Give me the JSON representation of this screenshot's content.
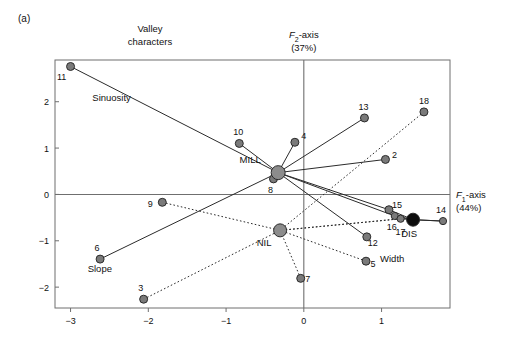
{
  "figure": {
    "panel_label": "(a)",
    "header": {
      "line1": "Valley",
      "line2": "characters"
    }
  },
  "axes": {
    "x_axis": {
      "label_main": "F",
      "label_sub": "1",
      "label_suffix": "-axis",
      "label_pct": "(44%)",
      "ticks": [
        -3,
        -2,
        -1,
        0,
        1
      ],
      "tick_labels": [
        "−3",
        "−2",
        "−1",
        "0",
        "1"
      ],
      "range": [
        -3.2,
        1.88
      ]
    },
    "y_axis": {
      "label_main": "F",
      "label_sub": "2",
      "label_suffix": "-axis",
      "label_pct": "(37%)",
      "ticks": [
        2,
        1,
        0,
        -1,
        -2
      ],
      "tick_labels": [
        "2",
        "1",
        "0",
        "−1",
        "−2"
      ],
      "range": [
        -2.45,
        2.9
      ]
    }
  },
  "colors": {
    "point_fill": "#7a7a7a",
    "point_stroke": "#2b2b2b",
    "centroid_fill": "#8c8c8c",
    "centroid_stroke": "#2b2b2b",
    "dis_fill": "#0d0d0d",
    "line": "#2b2b2b",
    "frame": "#6f6f6f",
    "axis": "#6f6f6f",
    "text": "#111111"
  },
  "chart_data": {
    "type": "scatter",
    "xlabel": "F1-axis (44%)",
    "ylabel": "F2-axis (37%)",
    "xlim": [
      -3.2,
      1.88
    ],
    "ylim": [
      -2.45,
      2.9
    ],
    "grid": false,
    "legend": "none",
    "groups": [
      {
        "name": "MILL",
        "centroid": {
          "x": -0.33,
          "y": 0.47
        },
        "centroid_label": "MILL",
        "label_offset": {
          "dx": -28,
          "dy": -10
        },
        "line_style": "solid",
        "centroid_size": 7,
        "centroid_fill": "#8c8c8c",
        "members": [
          "11",
          "10",
          "4",
          "13",
          "2",
          "8",
          "15",
          "16",
          "12",
          "6"
        ]
      },
      {
        "name": "NIL",
        "centroid": {
          "x": -0.305,
          "y": -0.775
        },
        "centroid_label": "NIL",
        "label_offset": {
          "dx": -16,
          "dy": 16
        },
        "line_style": "dotted",
        "centroid_size": 6.5,
        "centroid_fill": "#8c8c8c",
        "members": [
          "9",
          "3",
          "7",
          "18",
          "5",
          "17"
        ]
      },
      {
        "name": "DIS",
        "centroid": {
          "x": 1.405,
          "y": -0.545
        },
        "centroid_label": "DIS",
        "label_offset": {
          "dx": -4,
          "dy": 17
        },
        "line_style": "solid",
        "centroid_size": 6.5,
        "centroid_fill": "#0d0d0d",
        "members": [
          "14",
          "16b",
          "17b",
          "15b"
        ]
      }
    ],
    "points": [
      {
        "id": "11",
        "label": "11",
        "x": -3.0,
        "y": 2.76,
        "group": "MILL",
        "size": 4.0,
        "lx": -9,
        "ly": 14
      },
      {
        "id": "10",
        "label": "10",
        "x": -0.83,
        "y": 1.1,
        "group": "MILL",
        "size": 4.0,
        "lx": -1,
        "ly": -8
      },
      {
        "id": "4",
        "label": "4",
        "x": -0.115,
        "y": 1.125,
        "group": "MILL",
        "size": 4.0,
        "lx": 9,
        "ly": -3
      },
      {
        "id": "13",
        "label": "13",
        "x": 0.78,
        "y": 1.65,
        "group": "MILL",
        "size": 4.0,
        "lx": -1,
        "ly": -8
      },
      {
        "id": "2",
        "label": "2",
        "x": 1.05,
        "y": 0.755,
        "group": "MILL",
        "size": 4.0,
        "lx": 9,
        "ly": -1
      },
      {
        "id": "8",
        "label": "8",
        "x": -0.39,
        "y": 0.335,
        "group": "MILL",
        "size": 4.0,
        "lx": -3,
        "ly": 14
      },
      {
        "id": "12",
        "label": "12",
        "x": 0.81,
        "y": -0.915,
        "group": "MILL",
        "size": 4.0,
        "lx": 6,
        "ly": 9
      },
      {
        "id": "6",
        "label": "6",
        "x": -2.62,
        "y": -1.395,
        "group": "MILL",
        "size": 4.0,
        "lx": -3,
        "ly": -8
      },
      {
        "id": "15",
        "label": "15",
        "x": 1.095,
        "y": -0.33,
        "group": "MILL",
        "size": 4.0,
        "lx": 8,
        "ly": -2
      },
      {
        "id": "16",
        "label": "16",
        "x": 1.17,
        "y": -0.465,
        "group": "DIS",
        "size": 3.6,
        "lx": -3,
        "ly": 14
      },
      {
        "id": "17",
        "label": "17",
        "x": 1.245,
        "y": -0.525,
        "group": "NIL",
        "size": 3.6,
        "lx": 0,
        "ly": 16
      },
      {
        "id": "14",
        "label": "14",
        "x": 1.79,
        "y": -0.575,
        "group": "DIS",
        "size": 3.6,
        "lx": -2,
        "ly": -8
      },
      {
        "id": "9",
        "label": "9",
        "x": -1.82,
        "y": -0.17,
        "group": "NIL",
        "size": 4.0,
        "lx": -12,
        "ly": 5
      },
      {
        "id": "3",
        "label": "3",
        "x": -2.06,
        "y": -2.26,
        "group": "NIL",
        "size": 4.0,
        "lx": -3,
        "ly": -8
      },
      {
        "id": "7",
        "label": "7",
        "x": -0.04,
        "y": -1.81,
        "group": "NIL",
        "size": 4.0,
        "lx": 7,
        "ly": 4
      },
      {
        "id": "18",
        "label": "18",
        "x": 1.545,
        "y": 1.78,
        "group": "NIL",
        "size": 4.0,
        "lx": 0,
        "ly": -8
      },
      {
        "id": "5",
        "label": "5",
        "x": 0.8,
        "y": -1.44,
        "group": "NIL",
        "size": 4.0,
        "lx": 7,
        "ly": 6
      }
    ],
    "annotations": [
      {
        "id": "sinuosity",
        "text": "Sinuosity",
        "x": -2.72,
        "y": 2.02
      },
      {
        "id": "slope",
        "text": "Slope",
        "x": -2.78,
        "y": -1.68
      },
      {
        "id": "width",
        "text": "Width",
        "x": 0.98,
        "y": -1.45
      }
    ]
  }
}
